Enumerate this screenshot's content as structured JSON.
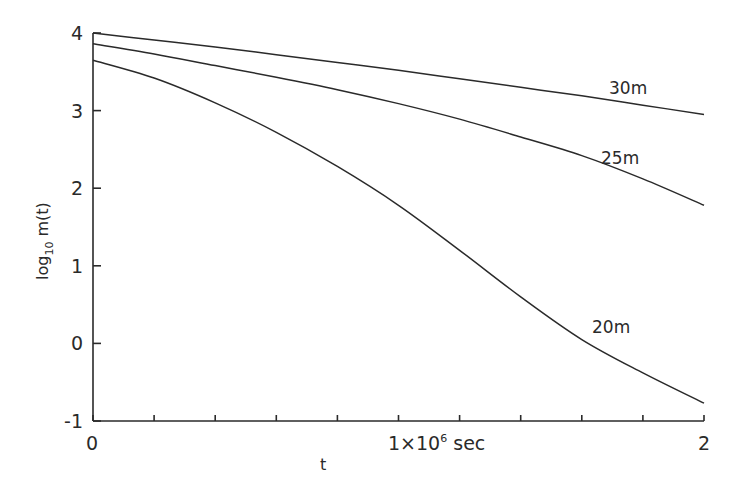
{
  "chart_data": {
    "type": "line",
    "title": "",
    "xlabel": "t",
    "ylabel": "log10 m(t)",
    "x_unit_label": "1×10⁶ sec",
    "xlim": [
      0,
      2
    ],
    "ylim": [
      -1,
      4
    ],
    "x_ticks": [
      0,
      0.2,
      0.4,
      0.6,
      0.8,
      1.0,
      1.2,
      1.4,
      1.6,
      1.8,
      2.0
    ],
    "x_tick_labels": [
      {
        "value": 0,
        "label": "0"
      },
      {
        "value": 1,
        "label": "1×10⁶ sec"
      },
      {
        "value": 2,
        "label": "2"
      }
    ],
    "y_ticks": [
      -1,
      0,
      1,
      2,
      3,
      4
    ],
    "y_tick_labels": [
      "-1",
      "0",
      "1",
      "2",
      "3",
      "4"
    ],
    "grid": false,
    "legend": "inline labels at line ends",
    "x": [
      0,
      0.2,
      0.4,
      0.6,
      0.8,
      1.0,
      1.2,
      1.4,
      1.6,
      1.8,
      2.0
    ],
    "series": [
      {
        "name": "30m",
        "values": [
          4.0,
          3.91,
          3.82,
          3.72,
          3.62,
          3.52,
          3.41,
          3.3,
          3.19,
          3.07,
          2.95
        ]
      },
      {
        "name": "25m",
        "values": [
          3.86,
          3.73,
          3.58,
          3.43,
          3.27,
          3.09,
          2.89,
          2.66,
          2.42,
          2.12,
          1.78
        ]
      },
      {
        "name": "20m",
        "values": [
          3.65,
          3.42,
          3.1,
          2.72,
          2.28,
          1.78,
          1.2,
          0.6,
          0.05,
          -0.38,
          -0.77
        ]
      }
    ]
  },
  "axes": {
    "y_title_main": "log",
    "y_title_sub": "10",
    "y_title_rest": " m(t)",
    "x_title": "t",
    "x_mid_label_pre": "1×10",
    "x_mid_label_sup": "6",
    "x_mid_label_post": " sec",
    "x_left_label": "0",
    "x_right_label": "2"
  },
  "curve_labels": {
    "s30": "30m",
    "s25": "25m",
    "s20": "20m"
  }
}
